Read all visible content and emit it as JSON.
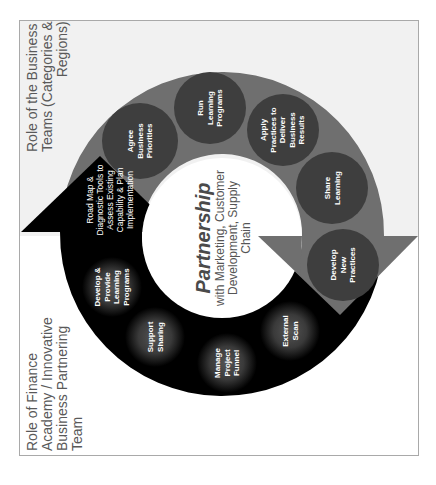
{
  "labels": {
    "business_teams": [
      "Role of the Business",
      "Teams (Categories &",
      "Regions)"
    ],
    "finance_academy": [
      "Role of Finance",
      "Academy / Innovative",
      "Business Partnering",
      "Team"
    ]
  },
  "center": {
    "title": "Partnership",
    "subtitle": [
      "with Marketing, Customer",
      "Development, Supply",
      "Chain"
    ]
  },
  "arrow_up": {
    "text": [
      "Road Map &",
      "Diagnostic Tools to",
      "Assess Existing",
      "Capability & Plan",
      "Implementation"
    ]
  },
  "business_nodes": [
    {
      "lines": [
        "Agree",
        "Business",
        "Priorities"
      ]
    },
    {
      "lines": [
        "Run",
        "Learning",
        "Programs"
      ]
    },
    {
      "lines": [
        "Apply",
        "Practices to",
        "Deliver",
        "Business",
        "Results"
      ]
    },
    {
      "lines": [
        "Share",
        "Learning"
      ]
    },
    {
      "lines": [
        "Develop",
        "New",
        "Practices"
      ]
    }
  ],
  "finance_nodes": [
    {
      "lines": [
        "Develop &",
        "Provide",
        "Learning",
        "Programs"
      ]
    },
    {
      "lines": [
        "Support",
        "Sharing"
      ]
    },
    {
      "lines": [
        "Manage",
        "Project",
        "Funnel"
      ]
    },
    {
      "lines": [
        "External",
        "Scan"
      ]
    }
  ],
  "colors": {
    "gray_ring": "#6f6f6f",
    "gray_node": "#3e3e3e",
    "black_ring": "#000000",
    "black_node_glow": "#4a4a4a",
    "top_background": "#f1f1f1",
    "label_text": "#595959"
  }
}
